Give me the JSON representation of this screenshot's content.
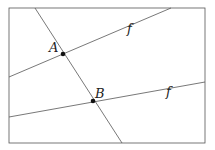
{
  "diagram": {
    "title": "",
    "frame": {
      "x1": 9,
      "y1": 8,
      "x2": 205,
      "y2": 143,
      "stroke": "#555555"
    },
    "lines": [
      {
        "id": "upper-f",
        "label": "f",
        "x1": 9,
        "y1": 77,
        "x2": 171,
        "y2": 8,
        "label_x": 127,
        "label_y": 33
      },
      {
        "id": "lower-f",
        "label": "f",
        "x1": 9,
        "y1": 117,
        "x2": 205,
        "y2": 82,
        "label_x": 166,
        "label_y": 96
      },
      {
        "id": "transversal",
        "label": "",
        "x1": 35,
        "y1": 8,
        "x2": 122,
        "y2": 143
      }
    ],
    "points": [
      {
        "id": "A",
        "label": "A",
        "x": 63,
        "y": 54,
        "label_x": 49,
        "label_y": 52
      },
      {
        "id": "B",
        "label": "B",
        "x": 93,
        "y": 101,
        "label_x": 95,
        "label_y": 98
      }
    ],
    "colors": {
      "line": "#555555",
      "point": "#111111",
      "text": "#222222"
    }
  }
}
